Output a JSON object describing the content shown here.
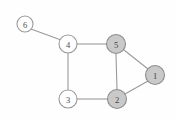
{
  "figure": {
    "kind": "undirected-graph-diagram",
    "background_color": "#fefefe",
    "width": 176,
    "height": 119
  },
  "style": {
    "node_fill_selected": "#c9c9c9",
    "node_fill_plain": "#ffffff",
    "node_stroke": "#9a9a9a",
    "edge_color": "#9a9a9a",
    "label_color": "#4a4a4a",
    "node_radius": 9,
    "node_radius_small": 8
  },
  "graph": {
    "nodes": [
      {
        "id": "n6",
        "label": "6",
        "cx": 25,
        "cy": 24,
        "r": 8,
        "filled": false
      },
      {
        "id": "n4",
        "label": "4",
        "cx": 68,
        "cy": 44,
        "r": 9,
        "filled": false
      },
      {
        "id": "n5",
        "label": "5",
        "cx": 116,
        "cy": 44,
        "r": 9.5,
        "filled": true
      },
      {
        "id": "n1",
        "label": "1",
        "cx": 155,
        "cy": 75,
        "r": 9.5,
        "filled": true
      },
      {
        "id": "n3",
        "label": "3",
        "cx": 68,
        "cy": 99,
        "r": 9,
        "filled": false
      },
      {
        "id": "n2",
        "label": "2",
        "cx": 117,
        "cy": 99,
        "r": 9.5,
        "filled": true
      }
    ],
    "edges": [
      {
        "id": "e64",
        "from": "n6",
        "to": "n4",
        "x1": 31,
        "y1": 29,
        "x2": 61,
        "y2": 40
      },
      {
        "id": "e45",
        "from": "n4",
        "to": "n5",
        "x1": 77,
        "y1": 44,
        "x2": 107,
        "y2": 44
      },
      {
        "id": "e43",
        "from": "n4",
        "to": "n3",
        "x1": 68,
        "y1": 53,
        "x2": 68,
        "y2": 90
      },
      {
        "id": "e32",
        "from": "n3",
        "to": "n2",
        "x1": 77,
        "y1": 99,
        "x2": 108,
        "y2": 99
      },
      {
        "id": "e52",
        "from": "n5",
        "to": "n2",
        "x1": 116,
        "y1": 54,
        "x2": 117,
        "y2": 90
      },
      {
        "id": "e51",
        "from": "n5",
        "to": "n1",
        "x1": 124,
        "y1": 50,
        "x2": 148,
        "y2": 69
      },
      {
        "id": "e21",
        "from": "n2",
        "to": "n1",
        "x1": 125,
        "y1": 94,
        "x2": 148,
        "y2": 81
      }
    ]
  }
}
